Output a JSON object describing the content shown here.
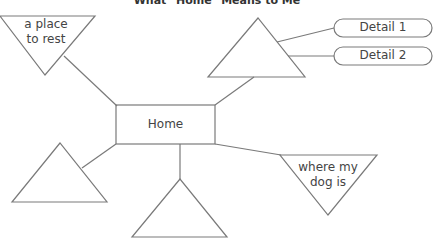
{
  "title": "What \"Home\" Means to Me",
  "center": {
    "label": "Home"
  },
  "nodes": [
    {
      "id": "top-left",
      "shape": "inverted-triangle",
      "text_line1": "a place",
      "text_line2": "to rest"
    },
    {
      "id": "top-right",
      "shape": "triangle",
      "text": "",
      "details": [
        "Detail 1",
        "Detail 2"
      ]
    },
    {
      "id": "bottom-right",
      "shape": "inverted-triangle",
      "text_line1": "where my",
      "text_line2": "dog is"
    },
    {
      "id": "bottom-left",
      "shape": "triangle",
      "text": ""
    },
    {
      "id": "bottom-center",
      "shape": "triangle",
      "text": ""
    }
  ],
  "colors": {
    "stroke": "#7a7a7a",
    "text": "#444444",
    "background": "#ffffff"
  }
}
